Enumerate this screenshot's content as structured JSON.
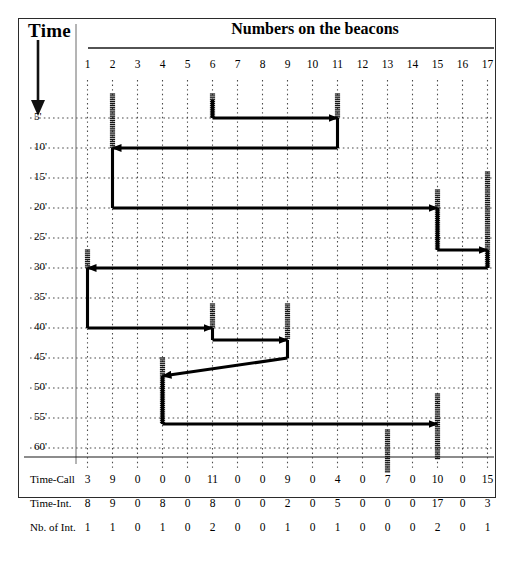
{
  "figure": {
    "time_axis_title": "Time",
    "beacons_axis_title": "Numbers on the beacons",
    "arrow_icon": "down-arrow-icon"
  },
  "chart_data": {
    "type": "line",
    "title": "Numbers on the beacons",
    "xlabel": "Numbers on the beacons",
    "ylabel": "Time",
    "grid": true,
    "legend": "none",
    "x": [
      1,
      2,
      3,
      4,
      5,
      6,
      7,
      8,
      9,
      10,
      11,
      12,
      13,
      14,
      15,
      16,
      17
    ],
    "x_tick_labels": [
      "1",
      "2",
      "3",
      "4",
      "5",
      "6",
      "7",
      "8",
      "9",
      "10",
      "11",
      "12",
      "13",
      "14",
      "15",
      "16",
      "17"
    ],
    "y_tick_labels": [
      "5'",
      "10'",
      "15'",
      "20'",
      "25'",
      "30'",
      "35'",
      "40'",
      "45'",
      "50'",
      "55'",
      "60'"
    ],
    "y_values": [
      5,
      10,
      15,
      20,
      25,
      30,
      35,
      40,
      45,
      50,
      55,
      60
    ],
    "ylim": [
      0,
      60
    ],
    "xlim": [
      1,
      17
    ],
    "path_points": [
      {
        "beacon": 6,
        "time": 2
      },
      {
        "beacon": 6,
        "time": 5
      },
      {
        "beacon": 11,
        "time": 5
      },
      {
        "beacon": 11,
        "time": 10
      },
      {
        "beacon": 2,
        "time": 10
      },
      {
        "beacon": 2,
        "time": 20
      },
      {
        "beacon": 15,
        "time": 20
      },
      {
        "beacon": 15,
        "time": 27
      },
      {
        "beacon": 17,
        "time": 27
      },
      {
        "beacon": 17,
        "time": 30
      },
      {
        "beacon": 1,
        "time": 30
      },
      {
        "beacon": 1,
        "time": 40
      },
      {
        "beacon": 6,
        "time": 40
      },
      {
        "beacon": 6,
        "time": 42
      },
      {
        "beacon": 9,
        "time": 42
      },
      {
        "beacon": 9,
        "time": 45
      },
      {
        "beacon": 4,
        "time": 48
      },
      {
        "beacon": 4,
        "time": 56
      },
      {
        "beacon": 15,
        "time": 56
      }
    ],
    "beacon_bars": [
      {
        "beacon": 2,
        "from_time": 1,
        "to_time": 10
      },
      {
        "beacon": 6,
        "from_time": 1,
        "to_time": 5
      },
      {
        "beacon": 11,
        "from_time": 1,
        "to_time": 5
      },
      {
        "beacon": 17,
        "from_time": 14,
        "to_time": 30
      },
      {
        "beacon": 15,
        "from_time": 17,
        "to_time": 27
      },
      {
        "beacon": 1,
        "from_time": 27,
        "to_time": 30
      },
      {
        "beacon": 6,
        "from_time": 36,
        "to_time": 40
      },
      {
        "beacon": 9,
        "from_time": 36,
        "to_time": 42
      },
      {
        "beacon": 4,
        "from_time": 45,
        "to_time": 56
      },
      {
        "beacon": 15,
        "from_time": 51,
        "to_time": 62
      },
      {
        "beacon": 13,
        "from_time": 57,
        "to_time": 64
      }
    ],
    "series": [
      {
        "name": "Time-Call",
        "values": [
          3,
          9,
          0,
          0,
          0,
          11,
          0,
          0,
          9,
          0,
          4,
          0,
          7,
          0,
          10,
          0,
          15
        ]
      },
      {
        "name": "Time-Int.",
        "values": [
          8,
          9,
          0,
          8,
          0,
          8,
          0,
          0,
          2,
          0,
          5,
          0,
          0,
          0,
          17,
          0,
          3
        ]
      },
      {
        "name": "Nb. of Int.",
        "values": [
          1,
          1,
          0,
          1,
          0,
          2,
          0,
          0,
          1,
          0,
          1,
          0,
          0,
          0,
          2,
          0,
          1
        ]
      }
    ]
  }
}
